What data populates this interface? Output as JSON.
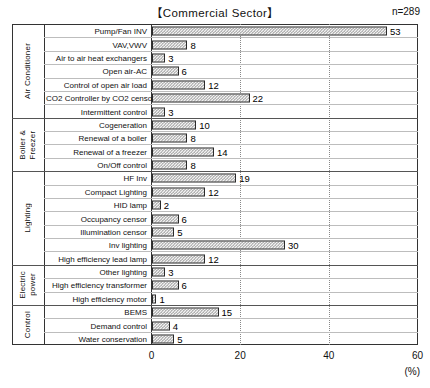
{
  "chart_data": {
    "type": "bar",
    "orientation": "horizontal",
    "title": "【Commercial Sector】",
    "sample_size_label": "n=289",
    "xlabel": "(%)",
    "ylabel": "",
    "xlim": [
      0,
      60
    ],
    "xticks": [
      0,
      20,
      40,
      60
    ],
    "xticklabels": [
      "0",
      "20",
      "40",
      "60"
    ],
    "grid": "vertical-dotted-at-20-and-40",
    "legend": "none",
    "categories": [
      "Pump/Fan INV",
      "VAV,VWV",
      "Air to air heat exchangers",
      "Open air-AC",
      "Control of open air load",
      "CO2 Controller by CO2 censor",
      "Intermittent control",
      "Cogeneration",
      "Renewal of a boiler",
      "Renewal of a freezer",
      "On/Off control",
      "HF Inv",
      "Compact Lighting",
      "HID lamp",
      "Occupancy censor",
      "Illumination censor",
      "Inv lighting",
      "High efficiency lead lamp",
      "Other lighting",
      "High efficiency transformer",
      "High efficiency motor",
      "BEMS",
      "Demand control",
      "Water conservation"
    ],
    "values": [
      53,
      8,
      3,
      6,
      12,
      22,
      3,
      10,
      8,
      14,
      8,
      19,
      12,
      2,
      6,
      5,
      30,
      12,
      3,
      6,
      1,
      15,
      4,
      5
    ],
    "groups": [
      {
        "name": "Air Conditioner",
        "start": 0,
        "count": 7
      },
      {
        "name": "Boiler &\nFreezer",
        "start": 7,
        "count": 4
      },
      {
        "name": "Lighting",
        "start": 11,
        "count": 7
      },
      {
        "name": "Electric\npower",
        "start": 18,
        "count": 3
      },
      {
        "name": "Control",
        "start": 21,
        "count": 3
      }
    ]
  }
}
